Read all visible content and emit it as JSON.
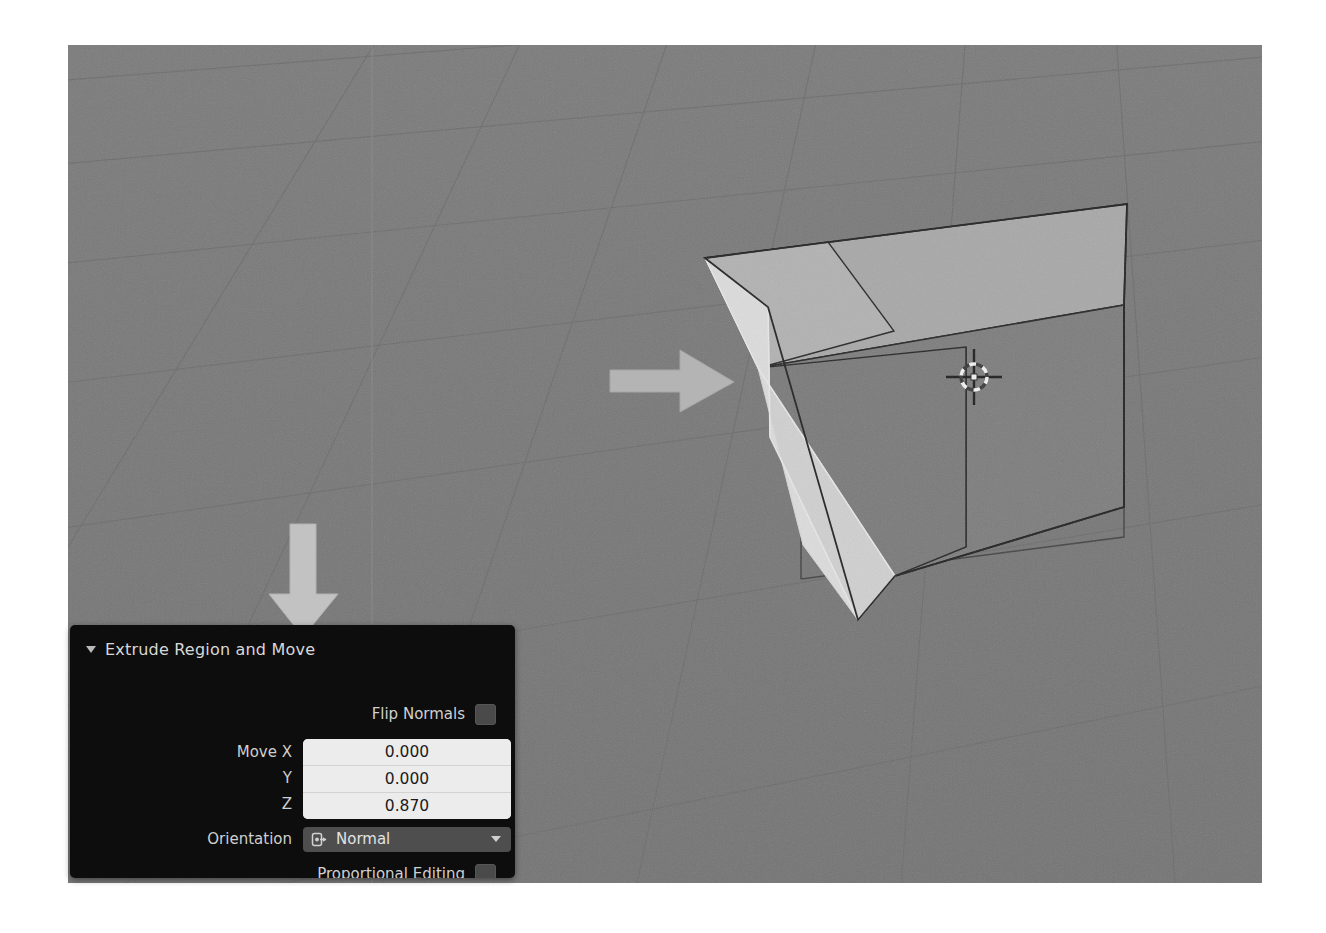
{
  "app": {
    "name": "Blender 3D Viewport",
    "viewport": {
      "background_color": "#777777",
      "grid_color": "#6a6a6a",
      "axis_z_color": "#7d7d7d",
      "object": "cube",
      "object_face_color": "#7a7a7a",
      "object_top_color": "#a6a6a6",
      "selected_face_color": "#d4d4d4",
      "edge_color": "#2a2a2a",
      "cursor_name": "3d-cursor"
    }
  },
  "annotations": [
    {
      "name": "arrow-right",
      "direction": "right",
      "color": "#b9b9b9",
      "points_to": "extruded-face"
    },
    {
      "name": "arrow-down",
      "direction": "down",
      "color": "#c8c8c8",
      "points_to": "redo-panel-header"
    }
  ],
  "redo_panel": {
    "title": "Extrude Region and Move",
    "expanded": true,
    "background_color": "#0d0d0d",
    "flip_normals": {
      "label": "Flip Normals",
      "checked": false
    },
    "move": {
      "labels": [
        "Move X",
        "Y",
        "Z"
      ],
      "values": [
        "0.000",
        "0.000",
        "0.870"
      ]
    },
    "orientation": {
      "label": "Orientation",
      "value": "Normal",
      "icon": "orientation-normal-icon"
    },
    "proportional_editing": {
      "label": "Proportional Editing",
      "checked": false
    }
  }
}
